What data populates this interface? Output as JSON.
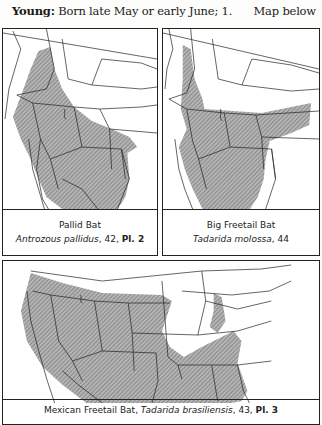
{
  "header": {
    "label": "Young:",
    "text": "Born late May or early June; 1.",
    "right_note": "Map below"
  },
  "maps": [
    {
      "common_name": "Pallid Bat",
      "scientific_name": "Antrozous pallidus",
      "suffix": ", 42, ",
      "plate": "Pl. 2"
    },
    {
      "common_name": "Big Freetail Bat",
      "scientific_name": "Tadarida molossa",
      "suffix": ", 44",
      "plate": ""
    },
    {
      "common_name": "Mexican Freetail Bat",
      "separator": ", ",
      "scientific_name": "Tadarida brasiliensis",
      "suffix": ", 43, ",
      "plate": "Pl. 3"
    }
  ],
  "colors": {
    "range_fill": "#9a9a9a",
    "border": "#222222",
    "paper": "#fdfdfb"
  }
}
